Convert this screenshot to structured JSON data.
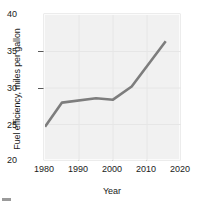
{
  "chart_data": {
    "type": "line",
    "title": "",
    "xlabel": "Year",
    "ylabel": "Fuel efficiency, miles per gallon",
    "xlim": [
      1980,
      2020
    ],
    "ylim": [
      20,
      40
    ],
    "xticks": [
      1980,
      1990,
      2000,
      2010,
      2020
    ],
    "yticks": [
      20,
      25,
      30,
      35,
      40
    ],
    "grid": true,
    "legend": null,
    "line_color": "#7d7d7d",
    "plot_background": "#f1f1f1",
    "series": [
      {
        "name": "Fuel efficiency",
        "x": [
          1980,
          1985,
          1995,
          2000,
          2005.5,
          2015.5
        ],
        "values": [
          24.7,
          28.0,
          28.6,
          28.4,
          30.2,
          36.4
        ]
      }
    ]
  },
  "axes": {
    "y_title": "Fuel efficiency, miles per gallon",
    "x_title": "Year",
    "y_tick_labels": [
      "40",
      "35",
      "30",
      "25",
      "20"
    ],
    "x_tick_labels": [
      "1980",
      "1990",
      "2000",
      "2010",
      "2020"
    ]
  }
}
